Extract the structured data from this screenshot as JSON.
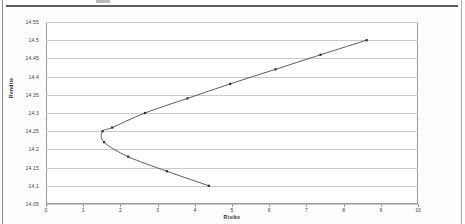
{
  "page": {
    "header_rule": "",
    "header_fragment": ""
  },
  "chart_data": {
    "type": "line",
    "title": "",
    "xlabel": "Risiko",
    "ylabel": "Rendite",
    "xlim": [
      0,
      10
    ],
    "ylim": [
      14.05,
      14.55
    ],
    "xticks": [
      "0",
      "1",
      "2",
      "3",
      "4",
      "5",
      "6",
      "7",
      "8",
      "9",
      "10"
    ],
    "xtick_values": [
      0,
      1,
      2,
      3,
      4,
      5,
      6,
      7,
      8,
      9,
      10
    ],
    "yticks": [
      "14.05",
      "14.1",
      "14.15",
      "14.2",
      "14.25",
      "14.3",
      "14.35",
      "14.4",
      "14.45",
      "14.5",
      "14.55"
    ],
    "ytick_values": [
      14.05,
      14.1,
      14.15,
      14.2,
      14.25,
      14.3,
      14.35,
      14.4,
      14.45,
      14.5,
      14.55
    ],
    "grid": true,
    "legend": false,
    "marker_color": "#2d2d2d",
    "line_color": "#4a4a4a",
    "grid_color": "#c9c9c9",
    "series": [
      {
        "name": "Effizienzkurve",
        "points": [
          {
            "x": 4.38,
            "y": 14.1
          },
          {
            "x": 3.25,
            "y": 14.14
          },
          {
            "x": 2.21,
            "y": 14.18
          },
          {
            "x": 1.56,
            "y": 14.22
          },
          {
            "x": 1.52,
            "y": 14.25
          },
          {
            "x": 1.78,
            "y": 14.26
          },
          {
            "x": 2.66,
            "y": 14.3
          },
          {
            "x": 3.8,
            "y": 14.34
          },
          {
            "x": 4.95,
            "y": 14.38
          },
          {
            "x": 6.17,
            "y": 14.42
          },
          {
            "x": 7.38,
            "y": 14.46
          },
          {
            "x": 8.62,
            "y": 14.5
          }
        ]
      }
    ]
  }
}
